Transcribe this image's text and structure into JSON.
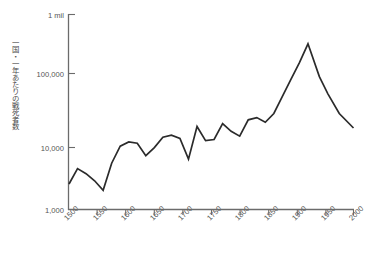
{
  "chart_data": {
    "type": "line",
    "title": "",
    "subtitle": "",
    "xlabel": "",
    "ylabel": "一国・一年あたりの戦死者数",
    "yscale": "log",
    "ylim": [
      1000,
      1000000
    ],
    "xlim": [
      1500,
      2000
    ],
    "grid": false,
    "legend": null,
    "ytick_labels": [
      "1 mil",
      "100,000",
      "10,000",
      "1,000"
    ],
    "ytick_values": [
      1000000,
      100000,
      10000,
      1000
    ],
    "xtick_labels": [
      "1500",
      "1550",
      "1600",
      "1650",
      "1700",
      "1750",
      "1800",
      "1850",
      "1900",
      "1950",
      "2000"
    ],
    "xtick_values": [
      1500,
      1550,
      1600,
      1650,
      1700,
      1750,
      1800,
      1850,
      1900,
      1950,
      2000
    ],
    "series": [
      {
        "name": "war-deaths-per-country-per-year",
        "color": "#2b2b2b",
        "x": [
          1500,
          1515,
          1530,
          1545,
          1560,
          1575,
          1590,
          1605,
          1620,
          1635,
          1650,
          1665,
          1680,
          1695,
          1710,
          1725,
          1740,
          1755,
          1770,
          1785,
          1800,
          1815,
          1830,
          1845,
          1860,
          1875,
          1890,
          1905,
          1920,
          1940,
          1955,
          1975,
          2000
        ],
        "y": [
          2500,
          4300,
          3600,
          2800,
          2000,
          5200,
          9500,
          11000,
          10500,
          6800,
          9000,
          13000,
          14000,
          12500,
          6000,
          19000,
          11500,
          12000,
          21000,
          16000,
          13500,
          24000,
          26000,
          22000,
          30000,
          55000,
          100000,
          180000,
          350000,
          110000,
          60000,
          30000,
          18000
        ]
      }
    ],
    "annotations": []
  }
}
